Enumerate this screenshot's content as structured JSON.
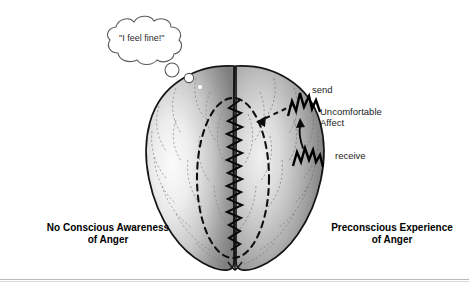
{
  "figure": {
    "type": "conceptual-diagram",
    "thought_bubble": {
      "text": "\"I feel fine!\"",
      "shape": "cloud",
      "tail_circles": 2
    },
    "annotations": {
      "send": "send",
      "uncomfortable": "Uncomfortable",
      "affect": "Affect",
      "receive": "receive"
    },
    "zone_labels": {
      "left_line1": "No Conscious Awareness",
      "left_line2": "of Anger",
      "right_line1": "Preconscious Experience",
      "right_line2": "of Anger"
    },
    "elements": {
      "left_hemisphere": "left-hemisphere",
      "right_hemisphere": "right-hemisphere",
      "midline_fissure": "midline-fissure",
      "dashed_ellipse": "dashed-ellipse-barrier",
      "zigzag_barrier": "vertical-zigzag-repression-barrier",
      "dashed_arrow": "dashed-arrow-to-barrier",
      "curved_arrow": "curved-arrow-receive-to-send",
      "zigzag_send": "lightning-zigzag-send",
      "zigzag_receive": "lightning-zigzag-receive",
      "white_dot": "small-white-dot"
    },
    "colors": {
      "brain_fill_mid": "#8a8a8a",
      "brain_fill_light": "#f2f2f2",
      "brain_outline": "#1a1a1a",
      "sulci": "#6f6f6f",
      "ink": "#000000",
      "rule": "#b9b9b9",
      "background": "#ffffff"
    }
  }
}
